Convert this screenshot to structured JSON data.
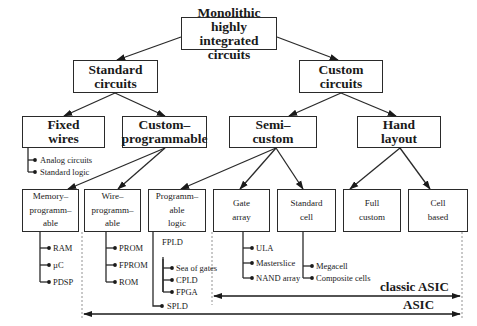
{
  "diagram": {
    "root": "Monolithic highly\nintegrated circuits",
    "level1": {
      "standard": "Standard\ncircuits",
      "custom": "Custom\ncircuits"
    },
    "level2": {
      "fixed_wires": "Fixed\nwires",
      "custom_programmable": "Custom–\nprogrammable",
      "semi_custom": "Semi–\ncustom",
      "hand_layout": "Hand\nlayout"
    },
    "level3": {
      "memory_programmable": "Memory–\nprogramm–\nable",
      "wire_programmable": "Wire–\nprogramm–\nable",
      "programmable_logic": "Programm–\nable\nlogic",
      "gate_array": "Gate\narray",
      "standard_cell": "Standard\ncell",
      "full_custom": "Full\ncustom",
      "cell_based": "Cell\nbased"
    },
    "leaves": {
      "fixed_wires": [
        "Analog circuits",
        "Standard logic"
      ],
      "memory_programmable": [
        "RAM",
        "µC",
        "PDSP"
      ],
      "wire_programmable": [
        "PROM",
        "FPROM",
        "ROM"
      ],
      "programmable_logic_group": "FPLD",
      "programmable_logic_fpld": [
        "Sea of gates",
        "CPLD",
        "FPGA"
      ],
      "programmable_logic_other": [
        "SPLD"
      ],
      "gate_array": [
        "ULA",
        "Masterslice",
        "NAND array"
      ],
      "standard_cell": [
        "Megacell",
        "Composite cells"
      ]
    },
    "ranges": {
      "classic_asic": "classic ASIC",
      "asic": "ASIC"
    }
  }
}
